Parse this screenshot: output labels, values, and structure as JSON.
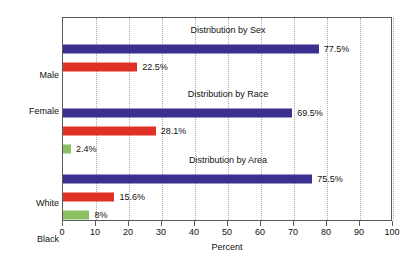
{
  "chart_data": {
    "type": "bar",
    "orientation": "horizontal",
    "title": "",
    "xlabel": "Percent",
    "ylabel": "",
    "xlim": [
      0,
      100
    ],
    "xticks": [
      0,
      10,
      20,
      30,
      40,
      50,
      60,
      70,
      80,
      90,
      100
    ],
    "xtick_labels": [
      "0",
      "10",
      "20",
      "30",
      "40",
      "50",
      "60",
      "70",
      "80",
      "90",
      "100"
    ],
    "grid": true,
    "grid_axis": "x",
    "legend": false,
    "groups": [
      {
        "title": "Distribution by Sex",
        "categories": [
          "Male",
          "Female"
        ],
        "values": [
          77.5,
          22.5
        ],
        "labels": [
          "77.5%",
          "22.5%"
        ],
        "colors": [
          "#3b2f8f",
          "#e03127"
        ]
      },
      {
        "title": "Distribution by Race",
        "categories": [
          "White",
          "Black",
          "Other"
        ],
        "values": [
          69.5,
          28.1,
          2.4
        ],
        "labels": [
          "69.5%",
          "28.1%",
          "2.4%"
        ],
        "colors": [
          "#3b2f8f",
          "#e03127",
          "#8cbf62"
        ]
      },
      {
        "title": "Distribution by Area",
        "categories": [
          "Cities",
          "Suburbs",
          "Rural Areas"
        ],
        "values": [
          75.5,
          15.6,
          8
        ],
        "labels": [
          "75.5%",
          "15.6%",
          "8%"
        ],
        "colors": [
          "#3b2f8f",
          "#e03127",
          "#8cbf62"
        ]
      }
    ],
    "colors": {
      "blue": "#3b2f8f",
      "red": "#e03127",
      "green": "#8cbf62",
      "frame": "#5a5a5a",
      "gridline": "#a8a8b8",
      "background": "#ffffff",
      "text": "#111111"
    }
  }
}
